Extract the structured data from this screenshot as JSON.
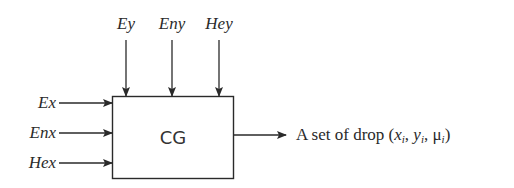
{
  "diagram": {
    "block": {
      "label": "CG"
    },
    "top_inputs": [
      {
        "label": "Ey",
        "x": 126
      },
      {
        "label": "Eny",
        "x": 172
      },
      {
        "label": "Hey",
        "x": 219
      }
    ],
    "left_inputs": [
      {
        "label": "Ex",
        "y": 103
      },
      {
        "label": "Enx",
        "y": 133
      },
      {
        "label": "Hex",
        "y": 163
      }
    ],
    "output": {
      "prefix": "A set of drop (",
      "var1": "x",
      "sub1": "i",
      "sep1": ", ",
      "var2": "y",
      "sub2": "i",
      "sep2": ", ",
      "var3": "μ",
      "sub3": "i",
      "suffix": ")"
    },
    "colors": {
      "stroke": "#2a2a2a",
      "background": "#ffffff"
    }
  }
}
